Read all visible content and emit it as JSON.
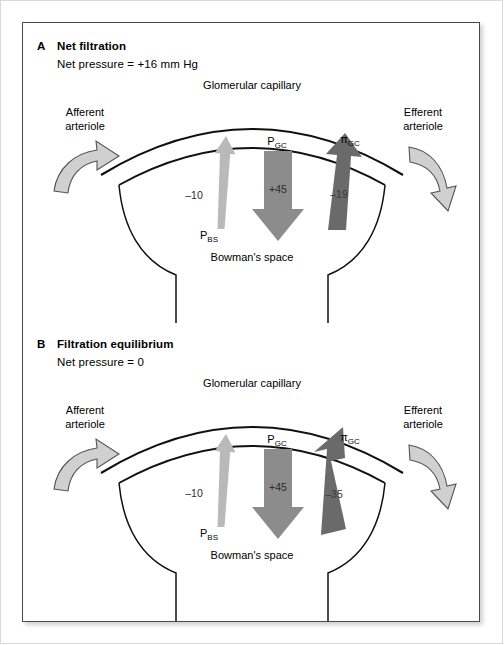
{
  "figure": {
    "colors": {
      "arrow_pbs": "#b9b9b9",
      "arrow_pgc": "#8c8c8c",
      "arrow_pigc": "#6a6a6a",
      "arteriole_arrow_fill": "#d0d0d0",
      "arteriole_arrow_stroke": "#555555",
      "outline": "#111111",
      "panel_border": "#4a4a4a"
    },
    "panels": [
      {
        "letter": "A",
        "heading": "Net filtration",
        "subtitle": "Net pressure = +16 mm Hg",
        "labels": {
          "capillary": "Glomerular capillary",
          "bowman_space": "Bowman's space",
          "afferent_line1": "Afferent",
          "afferent_line2": "arteriole",
          "efferent_line1": "Efferent",
          "efferent_line2": "arteriole"
        },
        "forces": [
          {
            "name": "bowman-space-hydrostatic-pressure",
            "symbol_base": "P",
            "symbol_sub": "BS",
            "value": "–10",
            "direction": "up",
            "shade": "light"
          },
          {
            "name": "glomerular-capillary-hydrostatic-pressure",
            "symbol_base": "P",
            "symbol_sub": "GC",
            "value": "+45",
            "direction": "down",
            "shade": "medium"
          },
          {
            "name": "glomerular-capillary-oncotic-pressure",
            "symbol_base": "π",
            "symbol_sub": "GC",
            "value": "–19",
            "direction": "up",
            "shade": "dark"
          }
        ]
      },
      {
        "letter": "B",
        "heading": "Filtration equilibrium",
        "subtitle": "Net pressure = 0",
        "labels": {
          "capillary": "Glomerular capillary",
          "bowman_space": "Bowman's space",
          "afferent_line1": "Afferent",
          "afferent_line2": "arteriole",
          "efferent_line1": "Efferent",
          "efferent_line2": "arteriole"
        },
        "forces": [
          {
            "name": "bowman-space-hydrostatic-pressure",
            "symbol_base": "P",
            "symbol_sub": "BS",
            "value": "–10",
            "direction": "up",
            "shade": "light"
          },
          {
            "name": "glomerular-capillary-hydrostatic-pressure",
            "symbol_base": "P",
            "symbol_sub": "GC",
            "value": "+45",
            "direction": "down",
            "shade": "medium"
          },
          {
            "name": "glomerular-capillary-oncotic-pressure",
            "symbol_base": "π",
            "symbol_sub": "GC",
            "value": "–35",
            "direction": "up",
            "shade": "dark"
          }
        ]
      }
    ]
  }
}
